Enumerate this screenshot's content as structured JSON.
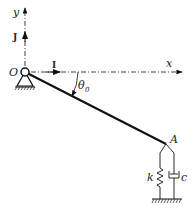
{
  "diagram": {
    "labels": {
      "y_axis": "y",
      "x_axis": "x",
      "unit_j": "J",
      "unit_i": "I",
      "origin": "O",
      "angle": "θ",
      "angle_sub": "0",
      "point_a": "A",
      "spring": "k",
      "damper": "c"
    },
    "colors": {
      "line": "#111111",
      "background": "#ffffff"
    }
  }
}
